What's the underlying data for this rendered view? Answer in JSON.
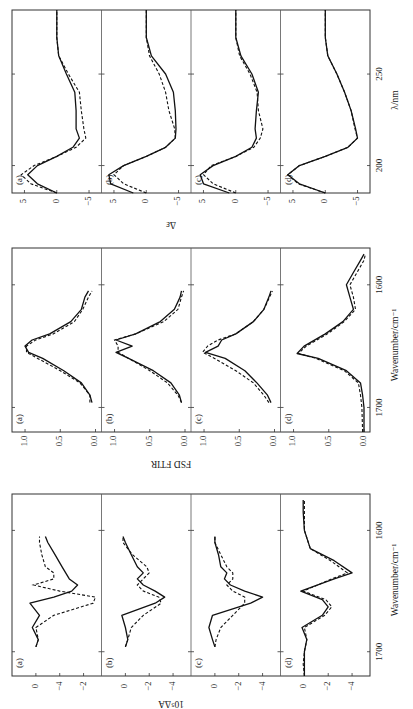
{
  "figure": {
    "orientation": "rotated 90 degrees counter-clockwise",
    "legend": {
      "solid": "solid line",
      "dashed": "dashed line"
    }
  },
  "chart_data": [
    {
      "type": "line",
      "title": "CD spectra",
      "xlabel": "λ/nm",
      "ylabel": "Δε",
      "xlim": [
        185,
        285
      ],
      "ylim": [
        -6,
        6
      ],
      "xticks": [
        200,
        250
      ],
      "yticks": [
        5,
        0,
        -5
      ],
      "panels": [
        {
          "label": "(a)",
          "x": [
            185,
            190,
            195,
            200,
            205,
            210,
            215,
            220,
            230,
            240,
            250,
            260,
            270,
            285
          ],
          "series": [
            {
              "name": "solid",
              "values": [
                0,
                3,
                4.5,
                3,
                0,
                -2.5,
                -3.5,
                -3,
                -3,
                -2.8,
                -1.5,
                -0.3,
                0,
                0
              ]
            },
            {
              "name": "dashed",
              "values": [
                0,
                4,
                5.5,
                3.5,
                0,
                -3,
                -4.5,
                -4.2,
                -3.8,
                -3.5,
                -1.8,
                -0.3,
                0,
                0
              ]
            }
          ]
        },
        {
          "label": "(b)",
          "x": [
            185,
            190,
            195,
            200,
            205,
            210,
            215,
            220,
            230,
            240,
            250,
            260,
            270,
            285
          ],
          "series": [
            {
              "name": "solid",
              "values": [
                2,
                5.5,
                5.8,
                3.5,
                0,
                -3,
                -4.5,
                -4.6,
                -4.5,
                -4.2,
                -3,
                -0.8,
                0,
                0
              ]
            },
            {
              "name": "dashed",
              "values": [
                0,
                3.5,
                5,
                3.5,
                0,
                -3,
                -4.5,
                -4.4,
                -3.5,
                -3,
                -2,
                -0.5,
                0,
                0
              ]
            }
          ]
        },
        {
          "label": "(c)",
          "x": [
            185,
            190,
            195,
            200,
            205,
            210,
            215,
            220,
            230,
            240,
            250,
            260,
            270,
            285
          ],
          "series": [
            {
              "name": "solid",
              "values": [
                1,
                5,
                5.5,
                3.5,
                0,
                -2.5,
                -3.2,
                -3,
                -3.2,
                -3.5,
                -2.5,
                -0.8,
                0,
                0
              ]
            },
            {
              "name": "dashed",
              "values": [
                0,
                3.5,
                5,
                3.8,
                0,
                -2.8,
                -3.8,
                -4.2,
                -3.5,
                -3.3,
                -2.2,
                -0.6,
                0,
                0
              ]
            }
          ]
        },
        {
          "label": "(d)",
          "x": [
            185,
            190,
            195,
            200,
            205,
            210,
            215,
            220,
            230,
            240,
            250,
            260,
            270,
            285
          ],
          "series": [
            {
              "name": "solid",
              "values": [
                0,
                4,
                5.8,
                4,
                0,
                -3.5,
                -5,
                -4.7,
                -4,
                -3,
                -1.8,
                -0.4,
                0,
                0
              ]
            },
            {
              "name": "dashed",
              "values": [
                0,
                4.2,
                5.8,
                4,
                0,
                -3.5,
                -5,
                -4.6,
                -4,
                -3,
                -1.8,
                -0.4,
                0,
                0
              ]
            }
          ]
        }
      ]
    },
    {
      "type": "line",
      "title": "Fourier self-deconvolved FTIR spectra",
      "xlabel": "Wavenumber/cm⁻¹",
      "ylabel": "FSD FTIR",
      "xlim": [
        1720,
        1570
      ],
      "ylim": [
        0,
        1.1
      ],
      "xticks": [
        1700,
        1600
      ],
      "yticks": [
        1.0,
        0.5,
        0.0
      ],
      "panels": [
        {
          "label": "(a)",
          "x": [
            1696,
            1690,
            1680,
            1670,
            1660,
            1655,
            1650,
            1645,
            1640,
            1630,
            1620,
            1610,
            1605
          ],
          "series": [
            {
              "name": "solid",
              "values": [
                0.05,
                0.08,
                0.2,
                0.45,
                0.75,
                0.95,
                1.0,
                0.9,
                0.65,
                0.35,
                0.2,
                0.15,
                0.1
              ]
            },
            {
              "name": "dashed",
              "values": [
                0.08,
                0.08,
                0.22,
                0.5,
                0.82,
                0.98,
                0.98,
                0.85,
                0.6,
                0.3,
                0.18,
                0.1,
                0.05
              ]
            }
          ]
        },
        {
          "label": "(b)",
          "x": [
            1696,
            1690,
            1680,
            1670,
            1660,
            1655,
            1650,
            1645,
            1640,
            1630,
            1620,
            1610,
            1605
          ],
          "series": [
            {
              "name": "solid",
              "values": [
                0.05,
                0.08,
                0.2,
                0.45,
                0.8,
                0.98,
                0.75,
                0.98,
                0.7,
                0.35,
                0.15,
                0.07,
                0.05
              ]
            },
            {
              "name": "dashed",
              "values": [
                0.05,
                0.1,
                0.25,
                0.5,
                0.8,
                0.95,
                0.95,
                1.0,
                0.7,
                0.3,
                0.1,
                0.05,
                0.02
              ]
            }
          ]
        },
        {
          "label": "(c)",
          "x": [
            1696,
            1690,
            1680,
            1670,
            1660,
            1655,
            1650,
            1645,
            1640,
            1630,
            1620,
            1610,
            1605
          ],
          "series": [
            {
              "name": "solid",
              "values": [
                0.05,
                0.1,
                0.25,
                0.42,
                0.7,
                0.98,
                0.8,
                0.75,
                0.55,
                0.3,
                0.15,
                0.08,
                0.05
              ]
            },
            {
              "name": "dashed",
              "values": [
                0.08,
                0.15,
                0.3,
                0.55,
                0.85,
                1.02,
                0.95,
                0.8,
                0.55,
                0.3,
                0.15,
                0.07,
                0.03
              ]
            }
          ]
        },
        {
          "label": "(d)",
          "x": [
            1720,
            1700,
            1690,
            1680,
            1670,
            1660,
            1656,
            1650,
            1640,
            1630,
            1620,
            1610,
            1600,
            1590,
            1580,
            1575
          ],
          "series": [
            {
              "name": "solid",
              "values": [
                0.0,
                0.0,
                0.02,
                0.05,
                0.25,
                0.65,
                0.95,
                0.85,
                0.55,
                0.3,
                0.15,
                0.2,
                0.25,
                0.15,
                0.05,
                0.0
              ]
            },
            {
              "name": "dashed",
              "values": [
                0.02,
                0.03,
                0.05,
                0.08,
                0.28,
                0.68,
                0.93,
                0.82,
                0.52,
                0.28,
                0.12,
                0.15,
                0.2,
                0.1,
                0.0,
                -0.02
              ]
            }
          ]
        }
      ]
    },
    {
      "type": "line",
      "title": "VCD spectra",
      "xlabel": "Wavenumber/cm⁻¹",
      "ylabel": "10⁵ΔA",
      "xlim": [
        1720,
        1570
      ],
      "ylim": [
        -5,
        1.5
      ],
      "xticks": [
        1700,
        1600
      ],
      "yticks_panel_a": [
        "0",
        "−4",
        "−2"
      ],
      "yticks": [
        0,
        -2,
        -4
      ],
      "panels": [
        {
          "label": "(a)",
          "x": [
            1696,
            1690,
            1680,
            1670,
            1660,
            1655,
            1650,
            1645,
            1640,
            1635,
            1630,
            1620,
            1610,
            1605
          ],
          "series": [
            {
              "name": "solid",
              "values": [
                0,
                -0.2,
                0.3,
                -0.3,
                0.5,
                -1.5,
                -3,
                -3.5,
                -2.8,
                -2.5,
                -2.2,
                -1.6,
                -1,
                -0.8
              ]
            },
            {
              "name": "dashed",
              "values": [
                0,
                -0.2,
                0,
                -1.5,
                -4.8,
                -5.0,
                -2,
                0.2,
                -1.5,
                -1.5,
                -0.8,
                -0.5,
                -0.3,
                -0.3
              ]
            }
          ]
        },
        {
          "label": "(b)",
          "x": [
            1696,
            1690,
            1680,
            1670,
            1660,
            1655,
            1650,
            1645,
            1640,
            1635,
            1630,
            1620,
            1610,
            1605
          ],
          "series": [
            {
              "name": "solid",
              "values": [
                0,
                -0.2,
                0,
                0.3,
                -2.5,
                -3.3,
                -2.5,
                -1.5,
                -1,
                -1.5,
                -1,
                -0.5,
                0,
                0.2
              ]
            },
            {
              "name": "dashed",
              "values": [
                0,
                -0.2,
                -0.5,
                -1.5,
                -3,
                -2.8,
                -1.5,
                -1,
                -1.5,
                -2,
                -1.8,
                -0.6,
                0.2,
                0.2
              ]
            }
          ]
        },
        {
          "label": "(c)",
          "x": [
            1696,
            1690,
            1680,
            1670,
            1660,
            1655,
            1650,
            1645,
            1640,
            1635,
            1630,
            1620,
            1610,
            1605
          ],
          "series": [
            {
              "name": "solid",
              "values": [
                0,
                0.2,
                0.5,
                0.2,
                -3,
                -4.0,
                -2.5,
                -1.3,
                -0.8,
                -1.0,
                -0.5,
                -0.3,
                0,
                0
              ]
            },
            {
              "name": "dashed",
              "values": [
                0,
                -0.1,
                -0.5,
                -1.5,
                -2.5,
                -2.5,
                -1.5,
                -1,
                -1.5,
                -1.5,
                -1.0,
                -0.5,
                0,
                0
              ]
            }
          ]
        },
        {
          "label": "(d)",
          "x": [
            1720,
            1710,
            1700,
            1690,
            1680,
            1670,
            1663,
            1657,
            1650,
            1640,
            1635,
            1625,
            1615,
            1600,
            1585,
            1575
          ],
          "series": [
            {
              "name": "solid",
              "values": [
                0,
                0,
                0,
                -0.2,
                0.2,
                -1.5,
                -2.0,
                -1.5,
                0.3,
                -2.5,
                -4.0,
                -2.5,
                -0.5,
                0,
                0.1,
                0.1
              ]
            },
            {
              "name": "dashed",
              "values": [
                0,
                0.1,
                0,
                -0.2,
                0,
                -1.7,
                -2.3,
                -1.8,
                0.1,
                -2.3,
                -3.6,
                -2.2,
                -0.5,
                0,
                0,
                0
              ]
            }
          ]
        }
      ]
    }
  ]
}
